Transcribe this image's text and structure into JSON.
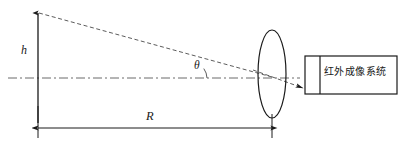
{
  "diagram": {
    "labels": {
      "height": "h",
      "range": "R",
      "angle": "θ",
      "system": "红外成像系统"
    },
    "colors": {
      "background": "#ffffff",
      "stroke": "#1a1a1a",
      "dashed_ray": "#555555",
      "center_line": "#666666"
    },
    "geometry": {
      "object_height_line": {
        "x": 38,
        "y_top": 12,
        "y_bottom": 123
      },
      "optical_axis_y": 78,
      "lens": {
        "cx": 272,
        "cy": 74,
        "rx": 14,
        "ry": 44
      },
      "range_dimension": {
        "x_start": 38,
        "x_end": 272,
        "y": 128
      },
      "angle_vertex": {
        "x": 190,
        "y": 78
      },
      "detector_box": {
        "x": 305,
        "y": 56,
        "width": 92,
        "height": 38,
        "divider_x": 320
      }
    }
  }
}
